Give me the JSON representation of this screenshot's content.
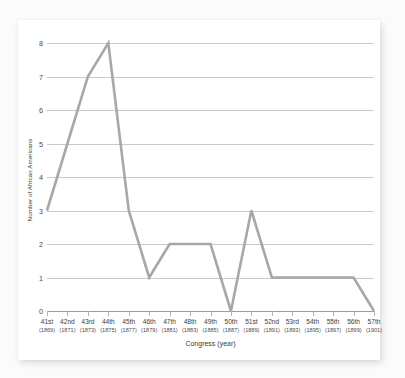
{
  "chart_data": {
    "type": "line",
    "title": "",
    "xlabel": "Congress (year)",
    "ylabel": "Number of African Americans",
    "categories": [
      "41st",
      "42nd",
      "43rd",
      "44th",
      "45th",
      "46th",
      "47th",
      "48th",
      "49th",
      "50th",
      "51st",
      "52nd",
      "53rd",
      "54th",
      "55th",
      "56th",
      "57th"
    ],
    "tick_sublabels": [
      "(1869)",
      "(1871)",
      "(1873)",
      "(1875)",
      "(1877)",
      "(1879)",
      "(1881)",
      "(1883)",
      "(1885)",
      "(1887)",
      "(1889)",
      "(1891)",
      "(1893)",
      "(1895)",
      "(1897)",
      "(1899)",
      "(1901)"
    ],
    "values": [
      3,
      5,
      7,
      8,
      3,
      1,
      2,
      2,
      2,
      0,
      3,
      1,
      1,
      1,
      1,
      1,
      0
    ],
    "ylim": [
      0,
      8
    ],
    "yticks": [
      0,
      1,
      2,
      3,
      4,
      5,
      6,
      7,
      8
    ],
    "ytick_labels": [
      "0",
      "1",
      "2",
      "3",
      "4",
      "5",
      "6",
      "7",
      "8"
    ],
    "grid": true,
    "legend": "none",
    "series_color": "#a8a8a8",
    "grid_color": "#c9c9c9",
    "axis_color": "#9c9c9c",
    "background_color": "#ffffff"
  }
}
